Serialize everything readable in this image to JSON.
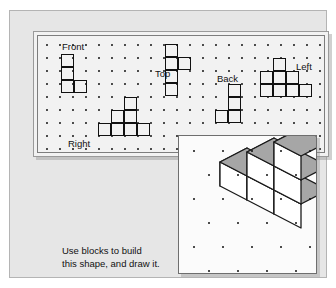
{
  "worksheet": {
    "caption_line1": "Use blocks to build",
    "caption_line2": "this shape, and draw it."
  },
  "views_panel": {
    "labels": [
      {
        "name": "front",
        "text": "Front",
        "x": 24,
        "y": 6
      },
      {
        "name": "top",
        "text": "Top",
        "x": 117,
        "y": 33
      },
      {
        "name": "back",
        "text": "Back",
        "x": 179,
        "y": 38
      },
      {
        "name": "left",
        "text": "Left",
        "x": 258,
        "y": 26
      },
      {
        "name": "right",
        "text": "Right",
        "x": 30,
        "y": 103
      }
    ],
    "shapes": [
      {
        "name": "front-view-shape",
        "label": "Front",
        "description": "Vertical column of three squares with one square attached right of the bottom square.",
        "cells": [
          [
            0,
            0
          ],
          [
            0,
            1
          ],
          [
            0,
            2
          ],
          [
            1,
            2
          ]
        ],
        "origin_x": 23,
        "origin_y": 18
      },
      {
        "name": "top-view-shape",
        "label": "Top",
        "description": "Vertical column of four squares with one square attached right of the second square.",
        "cells": [
          [
            0,
            0
          ],
          [
            0,
            1
          ],
          [
            1,
            1
          ],
          [
            0,
            2
          ],
          [
            0,
            3
          ]
        ],
        "origin_x": 127,
        "origin_y": 8
      },
      {
        "name": "back-view-shape",
        "label": "Back",
        "description": "Vertical column of three squares with one square attached left of the bottom square.",
        "cells": [
          [
            1,
            0
          ],
          [
            1,
            1
          ],
          [
            1,
            2
          ],
          [
            0,
            2
          ]
        ],
        "origin_x": 177,
        "origin_y": 48
      },
      {
        "name": "left-view-shape",
        "label": "Left",
        "description": "Staircase: one square on top, row of three below, extending one further right on bottom row.",
        "cells": [
          [
            1,
            0
          ],
          [
            0,
            1
          ],
          [
            1,
            1
          ],
          [
            2,
            1
          ],
          [
            0,
            2
          ],
          [
            1,
            2
          ],
          [
            2,
            2
          ],
          [
            3,
            2
          ]
        ],
        "origin_x": 222,
        "origin_y": 22
      },
      {
        "name": "right-view-shape",
        "label": "Right",
        "description": "Staircase: one square on top, two squares middle row, row of three on bottom.",
        "cells": [
          [
            2,
            0
          ],
          [
            1,
            1
          ],
          [
            2,
            1
          ],
          [
            0,
            2
          ],
          [
            1,
            2
          ],
          [
            2,
            2
          ],
          [
            3,
            2
          ]
        ],
        "origin_x": 60,
        "origin_y": 61
      }
    ],
    "grid": {
      "cols": 22,
      "rows": 9,
      "spacing_x": 13,
      "spacing_y": 13,
      "offset_x": 8,
      "offset_y": 8
    }
  },
  "iso_panel": {
    "name": "isometric-block-figure",
    "description": "Isometric drawing of a staircase of six unit cubes, gray top faces, white side faces.",
    "grid": {
      "cols": 5,
      "rows": 6,
      "spacing_x": 29,
      "spacing_y": 24,
      "offset_x": 14,
      "offset_y": 14
    },
    "cube_count": 6,
    "cubes": [
      {
        "x": 0,
        "y": 0,
        "z": 0
      },
      {
        "x": 1,
        "y": 0,
        "z": 0
      },
      {
        "x": 1,
        "y": 0,
        "z": 1
      },
      {
        "x": 2,
        "y": 0,
        "z": 0
      },
      {
        "x": 2,
        "y": 0,
        "z": 1
      },
      {
        "x": 2,
        "y": 0,
        "z": 2
      }
    ]
  },
  "colors": {
    "page_background": "#ffffff",
    "card_background": "#e6e6e6",
    "panel_background": "#f2f2f2",
    "iso_panel_background": "#fbfbfb",
    "ink": "#111111",
    "cube_top_face": "#a6a6a6",
    "cube_side_face": "#ffffff",
    "cube_outline": "#1a1a1a"
  }
}
